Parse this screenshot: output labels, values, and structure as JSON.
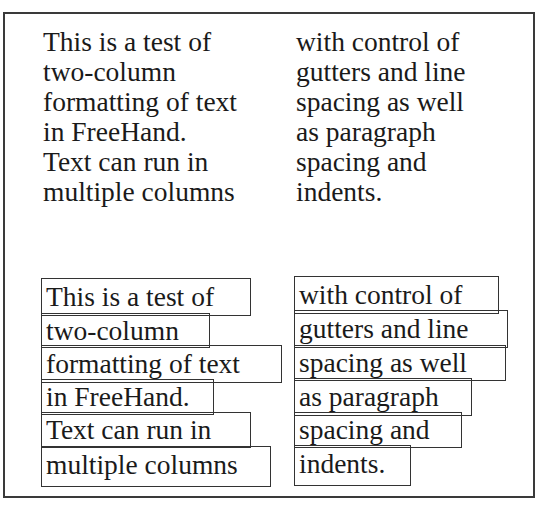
{
  "document": {
    "top_section": {
      "left_column": [
        "This is a test of",
        "two-column",
        "formatting of text",
        "in FreeHand.",
        "Text can run in",
        "multiple columns"
      ],
      "right_column": [
        "with control of",
        "gutters and line",
        "spacing as well",
        "as paragraph",
        "spacing and",
        "indents."
      ]
    },
    "bottom_section": {
      "left_column": [
        "This is a test of",
        "two-column",
        "formatting of text",
        "in FreeHand.",
        "Text can run in",
        "multiple columns"
      ],
      "right_column": [
        "with control of",
        "gutters and line",
        "spacing as well",
        "as paragraph",
        "spacing and",
        "indents."
      ]
    }
  }
}
